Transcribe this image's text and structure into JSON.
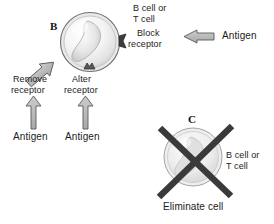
{
  "figure": {
    "background_color": "#ffffff",
    "ink_color": "#1b1b1b",
    "arrow_fill": "#b3b3b3",
    "arrow_stroke": "#4d4d4d",
    "cell_outline": "#7a7a7a",
    "cell_fill": "#f2f2f2",
    "x_mark_color": "#3a3a3a"
  },
  "panels": [
    {
      "id": "panel-b",
      "letter": "B",
      "cell_label": "B cell or\nT cell",
      "cell_label_line1": "B cell or",
      "cell_label_line2": "T cell",
      "annotations": [
        {
          "name": "block-receptor",
          "line1": "Block",
          "line2": "receptor",
          "arrow_direction": "left",
          "source_label": "Antigen"
        },
        {
          "name": "remove-receptor",
          "line1": "Remove",
          "line2": "receptor",
          "arrow_direction": "up-right",
          "source_label": "Antigen"
        },
        {
          "name": "alter-receptor",
          "line1": "Alter",
          "line2": "receptor",
          "arrow_direction": "up",
          "source_label": "Antigen"
        }
      ]
    },
    {
      "id": "panel-c",
      "letter": "C",
      "cell_label_line1": "B cell or",
      "cell_label_line2": "T cell",
      "action_label": "Eliminate cell",
      "marker": "x-cross"
    }
  ],
  "labels": {
    "panel_b_letter": "B",
    "panel_c_letter": "C",
    "b_cell_or": "B cell or",
    "t_cell": "T cell",
    "block": "Block",
    "receptor": "receptor",
    "remove": "Remove",
    "alter": "Alter",
    "antigen": "Antigen",
    "eliminate_cell": "Eliminate cell",
    "c_b_cell_or": "B cell or",
    "c_t_cell": "T cell"
  }
}
